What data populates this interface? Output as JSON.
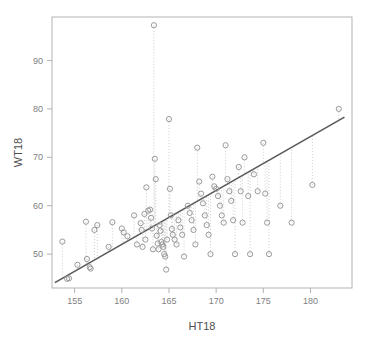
{
  "chart_data": {
    "type": "scatter",
    "title": "",
    "xlabel": "HT18",
    "ylabel": "WT18",
    "xlim": [
      152.6,
      184.4
    ],
    "ylim": [
      43.0,
      99.0
    ],
    "xticks": [
      155,
      160,
      165,
      170,
      175,
      180
    ],
    "yticks": [
      50,
      60,
      70,
      80,
      90
    ],
    "grid": false,
    "legend": null,
    "marker": "open-circle",
    "marker_color": "#999999",
    "regression_line_color": "#595959",
    "residual_line_color": "#cccccc",
    "residual_line_style": "dotted",
    "frame_color": "#b3b3b3",
    "regression_line": {
      "x": [
        152.9,
        183.6
      ],
      "y": [
        44.1,
        78.3
      ],
      "slope": 1.114,
      "intercept": -126.2
    },
    "series": [
      {
        "name": "WT18 vs HT18",
        "points": [
          [
            153.7,
            52.6
          ],
          [
            154.2,
            44.9
          ],
          [
            154.4,
            45.0
          ],
          [
            155.3,
            47.8
          ],
          [
            156.2,
            56.7
          ],
          [
            156.3,
            49.0
          ],
          [
            156.6,
            47.3
          ],
          [
            156.7,
            47.0
          ],
          [
            157.1,
            55.0
          ],
          [
            157.4,
            56.0
          ],
          [
            158.6,
            51.5
          ],
          [
            159.0,
            56.6
          ],
          [
            160.0,
            55.3
          ],
          [
            160.2,
            54.5
          ],
          [
            160.6,
            53.7
          ],
          [
            161.3,
            58.0
          ],
          [
            161.6,
            52.0
          ],
          [
            162.0,
            56.4
          ],
          [
            162.1,
            55.0
          ],
          [
            162.2,
            51.5
          ],
          [
            162.4,
            58.3
          ],
          [
            162.5,
            53.0
          ],
          [
            162.6,
            63.8
          ],
          [
            162.8,
            59.0
          ],
          [
            163.0,
            59.2
          ],
          [
            163.1,
            57.5
          ],
          [
            163.2,
            55.3
          ],
          [
            163.3,
            51.0
          ],
          [
            163.4,
            97.3
          ],
          [
            163.5,
            69.7
          ],
          [
            163.6,
            65.5
          ],
          [
            163.7,
            53.8
          ],
          [
            163.8,
            52.2
          ],
          [
            163.9,
            51.0
          ],
          [
            164.0,
            56.0
          ],
          [
            164.1,
            54.8
          ],
          [
            164.2,
            52.5
          ],
          [
            164.3,
            52.0
          ],
          [
            164.4,
            51.5
          ],
          [
            164.5,
            50.0
          ],
          [
            164.6,
            49.5
          ],
          [
            164.7,
            46.8
          ],
          [
            164.8,
            53.0
          ],
          [
            165.0,
            77.9
          ],
          [
            165.1,
            63.5
          ],
          [
            165.2,
            58.0
          ],
          [
            165.3,
            55.2
          ],
          [
            165.4,
            54.0
          ],
          [
            165.6,
            53.0
          ],
          [
            165.8,
            52.0
          ],
          [
            166.0,
            57.0
          ],
          [
            166.2,
            55.5
          ],
          [
            166.4,
            54.0
          ],
          [
            166.6,
            49.5
          ],
          [
            167.0,
            60.0
          ],
          [
            167.2,
            58.5
          ],
          [
            167.4,
            57.0
          ],
          [
            167.6,
            55.0
          ],
          [
            167.8,
            52.0
          ],
          [
            168.0,
            72.0
          ],
          [
            168.2,
            65.0
          ],
          [
            168.4,
            62.5
          ],
          [
            168.6,
            60.5
          ],
          [
            168.8,
            58.0
          ],
          [
            169.0,
            56.0
          ],
          [
            169.2,
            54.0
          ],
          [
            169.4,
            50.0
          ],
          [
            169.6,
            66.0
          ],
          [
            169.8,
            64.0
          ],
          [
            170.0,
            63.5
          ],
          [
            170.2,
            62.0
          ],
          [
            170.4,
            60.0
          ],
          [
            170.6,
            58.0
          ],
          [
            170.8,
            56.5
          ],
          [
            171.0,
            72.5
          ],
          [
            171.2,
            65.5
          ],
          [
            171.4,
            63.0
          ],
          [
            171.6,
            61.0
          ],
          [
            171.8,
            57.0
          ],
          [
            172.0,
            50.0
          ],
          [
            172.4,
            68.0
          ],
          [
            172.6,
            63.0
          ],
          [
            172.8,
            56.5
          ],
          [
            173.0,
            70.0
          ],
          [
            173.4,
            62.0
          ],
          [
            173.6,
            50.0
          ],
          [
            174.0,
            66.5
          ],
          [
            174.4,
            63.0
          ],
          [
            175.0,
            73.0
          ],
          [
            175.2,
            62.5
          ],
          [
            175.4,
            56.5
          ],
          [
            175.6,
            50.0
          ],
          [
            176.8,
            60.0
          ],
          [
            178.0,
            56.5
          ],
          [
            180.2,
            64.3
          ],
          [
            183.0,
            80.0
          ]
        ]
      }
    ]
  }
}
